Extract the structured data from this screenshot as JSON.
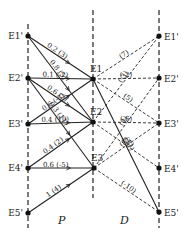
{
  "diagram": {
    "columns": [
      {
        "id": "P",
        "label": "P"
      },
      {
        "id": "D",
        "label": "D"
      }
    ],
    "left_nodes": [
      {
        "id": "L1",
        "label": "E1'",
        "x": 28,
        "y": 36
      },
      {
        "id": "L2",
        "label": "E2'",
        "x": 28,
        "y": 78
      },
      {
        "id": "L3",
        "label": "E3'",
        "x": 28,
        "y": 124
      },
      {
        "id": "L4",
        "label": "E4'",
        "x": 28,
        "y": 168
      },
      {
        "id": "L5",
        "label": "E5'",
        "x": 28,
        "y": 213
      }
    ],
    "middle_nodes": [
      {
        "id": "M1",
        "label": "E1",
        "x": 93,
        "y": 79
      },
      {
        "id": "M2",
        "label": "E2",
        "x": 93,
        "y": 122
      },
      {
        "id": "M3",
        "label": "E3",
        "x": 94,
        "y": 168
      }
    ],
    "right_nodes": [
      {
        "id": "R1",
        "label": "E1'",
        "x": 159,
        "y": 36
      },
      {
        "id": "R2",
        "label": "E2'",
        "x": 159,
        "y": 78
      },
      {
        "id": "R3",
        "label": "E3'",
        "x": 159,
        "y": 123
      },
      {
        "id": "R4",
        "label": "E4'",
        "x": 159,
        "y": 168
      },
      {
        "id": "R5",
        "label": "E5'",
        "x": 159,
        "y": 212
      }
    ],
    "p_edges": [
      {
        "from": "L1",
        "to": "M1",
        "label": "0.2 (3)"
      },
      {
        "from": "L1",
        "to": "M2",
        "label": "0.8 (5)"
      },
      {
        "from": "L2",
        "to": "M1",
        "label": "0.1 (-2)"
      },
      {
        "from": "L2",
        "to": "M2",
        "label": "0.6 (2)"
      },
      {
        "from": "L2",
        "to": "M3",
        "label": "0.3 (11)"
      },
      {
        "from": "L3",
        "to": "M1",
        "label": "0.6 (-3)"
      },
      {
        "from": "L3",
        "to": "M2",
        "label": "0.4 (10)"
      },
      {
        "from": "L4",
        "to": "M2",
        "label": "0.4 (2)"
      },
      {
        "from": "L4",
        "to": "M3",
        "label": "0.6 (-5)"
      },
      {
        "from": "L5",
        "to": "M3",
        "label": "1 (4)"
      }
    ],
    "d_edges": [
      {
        "from": "M1",
        "to": "R1",
        "label": "(7)",
        "style": "dashed"
      },
      {
        "from": "M2",
        "to": "R1",
        "label": "(-3)",
        "style": "dashed"
      },
      {
        "from": "M1",
        "to": "R2",
        "label": "(-2)",
        "style": "dashed"
      },
      {
        "from": "M3",
        "to": "R2",
        "label": "(4)",
        "style": "dashed"
      },
      {
        "from": "M1",
        "to": "R3",
        "label": "(5)",
        "style": "dashed"
      },
      {
        "from": "M2",
        "to": "R3",
        "label": "(-6)",
        "style": "dashed"
      },
      {
        "from": "M3",
        "to": "R3",
        "label": "(5)",
        "style": "dashed"
      },
      {
        "from": "M2",
        "to": "R4",
        "label": "(-2)",
        "style": "dashed"
      },
      {
        "from": "M1",
        "to": "R5",
        "label": "(11)",
        "style": "solid"
      },
      {
        "from": "M3",
        "to": "R5",
        "label": "(-10)",
        "style": "dashed"
      }
    ]
  }
}
